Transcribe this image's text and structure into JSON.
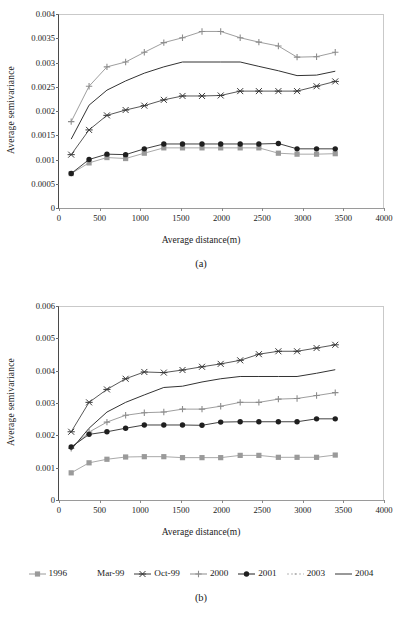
{
  "figure": {
    "panels": [
      {
        "id": "a",
        "caption": "(a)",
        "xlabel": "Average distance(m)",
        "ylabel": "Average semivariance"
      },
      {
        "id": "b",
        "caption": "(b)",
        "xlabel": "Average distance(m)",
        "ylabel": "Average semivariance"
      }
    ]
  },
  "legend": {
    "items": [
      {
        "label": "1996",
        "color": "#9a9a9a",
        "marker": "square",
        "dash": "none"
      },
      {
        "label": "Mar-99",
        "color": "#bdbdbd",
        "marker": "none",
        "dash": "none"
      },
      {
        "label": "Oct-99",
        "color": "#3a3a3a",
        "marker": "star",
        "dash": "none"
      },
      {
        "label": "2000",
        "color": "#8d8d8d",
        "marker": "plus",
        "dash": "none"
      },
      {
        "label": "2001",
        "color": "#1f1f1f",
        "marker": "circle",
        "dash": "none"
      },
      {
        "label": "2003",
        "color": "#b5b5b5",
        "marker": "dot",
        "dash": "2,2"
      },
      {
        "label": "2004",
        "color": "#333333",
        "marker": "none",
        "dash": "none"
      }
    ]
  },
  "chart_data": [
    {
      "id": "a",
      "type": "line",
      "title": "(a)",
      "xlabel": "Average distance(m)",
      "ylabel": "Average semivariance",
      "xlim": [
        0,
        4000
      ],
      "ylim": [
        0,
        0.004
      ],
      "xticks": [
        0,
        500,
        1000,
        1500,
        2000,
        2500,
        3000,
        3500,
        4000
      ],
      "yticks": [
        0,
        0.0005,
        0.001,
        0.0015,
        0.002,
        0.0025,
        0.003,
        0.0035,
        0.004
      ],
      "ytick_labels": [
        "0",
        "0.0005",
        "0.001",
        "0.0015",
        "0.002",
        "0.0025",
        "0.003",
        "0.0035",
        "0.004"
      ],
      "grid": false,
      "legend_position": "bottom-shared",
      "x": [
        150,
        370,
        590,
        820,
        1050,
        1290,
        1520,
        1760,
        1990,
        2230,
        2460,
        2700,
        2930,
        3170,
        3400
      ],
      "series": [
        {
          "name": "1996",
          "marker": "square",
          "color": "#9a9a9a",
          "values": [
            0.00071,
            0.00093,
            0.00104,
            0.00102,
            0.00113,
            0.00124,
            0.00124,
            0.00124,
            0.00124,
            0.00124,
            0.00124,
            0.00113,
            0.00111,
            0.00111,
            0.00112
          ]
        },
        {
          "name": "Mar-99",
          "marker": "none",
          "color": "#bdbdbd",
          "values": [
            null,
            null,
            null,
            null,
            null,
            null,
            null,
            null,
            null,
            null,
            null,
            null,
            null,
            null,
            null
          ]
        },
        {
          "name": "Oct-99",
          "marker": "star",
          "color": "#3a3a3a",
          "values": [
            0.0011,
            0.00161,
            0.00191,
            0.00202,
            0.00211,
            0.00223,
            0.00231,
            0.00231,
            0.00232,
            0.00241,
            0.00241,
            0.00241,
            0.00241,
            0.00251,
            0.00261
          ]
        },
        {
          "name": "2000",
          "marker": "plus",
          "color": "#8d8d8d",
          "values": [
            0.00178,
            0.00251,
            0.00291,
            0.00301,
            0.00321,
            0.00341,
            0.00351,
            0.00364,
            0.00364,
            0.00351,
            0.00342,
            0.00334,
            0.00311,
            0.00312,
            0.00321
          ]
        },
        {
          "name": "2001",
          "marker": "circle",
          "color": "#1f1f1f",
          "values": [
            0.00071,
            0.001,
            0.00111,
            0.0011,
            0.00122,
            0.00132,
            0.00132,
            0.00132,
            0.00132,
            0.00132,
            0.00132,
            0.00133,
            0.00122,
            0.00122,
            0.00122
          ]
        },
        {
          "name": "2003",
          "marker": "dot",
          "color": "#b5b5b5",
          "values": [
            null,
            null,
            null,
            null,
            null,
            null,
            null,
            null,
            null,
            null,
            null,
            null,
            null,
            null,
            null
          ]
        },
        {
          "name": "2004",
          "marker": "none",
          "color": "#333333",
          "values": [
            0.00142,
            0.00212,
            0.00243,
            0.00262,
            0.00278,
            0.00291,
            0.00301,
            0.00301,
            0.00301,
            0.00301,
            0.00292,
            0.00283,
            0.00273,
            0.00274,
            0.00282
          ]
        }
      ]
    },
    {
      "id": "b",
      "type": "line",
      "title": "(b)",
      "xlabel": "Average distance(m)",
      "ylabel": "Average semivariance",
      "xlim": [
        0,
        4000
      ],
      "ylim": [
        0,
        0.006
      ],
      "xticks": [
        0,
        500,
        1000,
        1500,
        2000,
        2500,
        3000,
        3500,
        4000
      ],
      "yticks": [
        0,
        0.001,
        0.002,
        0.003,
        0.004,
        0.005,
        0.006
      ],
      "ytick_labels": [
        "0",
        "0.001",
        "0.002",
        "0.003",
        "0.004",
        "0.005",
        "0.006"
      ],
      "grid": false,
      "legend_position": "bottom-shared",
      "x": [
        150,
        370,
        590,
        820,
        1050,
        1290,
        1520,
        1760,
        1990,
        2230,
        2460,
        2700,
        2930,
        3170,
        3400
      ],
      "series": [
        {
          "name": "1996",
          "marker": "square",
          "color": "#9a9a9a",
          "values": [
            0.00084,
            0.00115,
            0.00126,
            0.00133,
            0.00134,
            0.00134,
            0.00131,
            0.00131,
            0.00131,
            0.00138,
            0.00138,
            0.00132,
            0.00132,
            0.00132,
            0.00139
          ]
        },
        {
          "name": "Mar-99",
          "marker": "none",
          "color": "#bdbdbd",
          "values": [
            null,
            null,
            null,
            null,
            null,
            null,
            null,
            null,
            null,
            null,
            null,
            null,
            null,
            null,
            null
          ]
        },
        {
          "name": "Oct-99",
          "marker": "star",
          "color": "#3a3a3a",
          "values": [
            0.00211,
            0.00302,
            0.00342,
            0.00375,
            0.00396,
            0.00394,
            0.00402,
            0.00412,
            0.00421,
            0.00432,
            0.00451,
            0.0046,
            0.0046,
            0.0047,
            0.0048
          ]
        },
        {
          "name": "2000",
          "marker": "plus",
          "color": "#8d8d8d",
          "values": [
            0.0016,
            0.0021,
            0.00241,
            0.00262,
            0.0027,
            0.00272,
            0.00281,
            0.00281,
            0.0029,
            0.00302,
            0.00302,
            0.00312,
            0.00314,
            0.00323,
            0.00332
          ]
        },
        {
          "name": "2001",
          "marker": "circle",
          "color": "#1f1f1f",
          "values": [
            0.00164,
            0.00203,
            0.00211,
            0.00222,
            0.00232,
            0.00232,
            0.00232,
            0.00231,
            0.00241,
            0.00242,
            0.00242,
            0.00242,
            0.00242,
            0.00251,
            0.00251
          ]
        },
        {
          "name": "2003",
          "marker": "dot",
          "color": "#b5b5b5",
          "values": [
            null,
            null,
            null,
            null,
            null,
            null,
            null,
            null,
            null,
            null,
            null,
            null,
            null,
            null,
            null
          ]
        },
        {
          "name": "2004",
          "marker": "none",
          "color": "#333333",
          "values": [
            0.00156,
            0.00222,
            0.00272,
            0.00302,
            0.00325,
            0.00348,
            0.00352,
            0.00365,
            0.00375,
            0.00382,
            0.00382,
            0.00382,
            0.00382,
            0.00392,
            0.00403
          ]
        }
      ]
    }
  ]
}
